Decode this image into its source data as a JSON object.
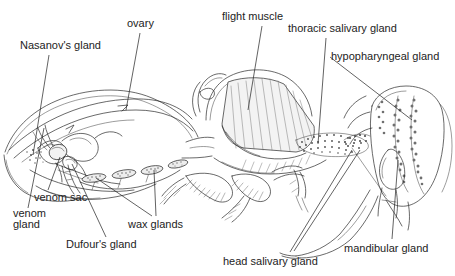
{
  "diagram": {
    "type": "anatomical-line-drawing",
    "background_color": "#ffffff",
    "ink_color": "#2a2a2a",
    "text_color": "#232323",
    "width": 455,
    "height": 276
  },
  "labels": [
    {
      "id": "nasanovs-gland",
      "text": "Nasanov's gland",
      "x": 20,
      "y": 40
    },
    {
      "id": "ovary",
      "text": "ovary",
      "x": 127,
      "y": 18
    },
    {
      "id": "flight-muscle",
      "text": "flight muscle",
      "x": 222,
      "y": 11
    },
    {
      "id": "thoracic-salivary",
      "text": "thoracic salivary gland",
      "x": 288,
      "y": 23
    },
    {
      "id": "hypopharyngeal-gland",
      "text": "hypopharyngeal gland",
      "x": 331,
      "y": 51
    },
    {
      "id": "venom-sac",
      "text": "venom sac",
      "x": 34,
      "y": 192
    },
    {
      "id": "venom-gland-line1",
      "text": "venom",
      "x": 13,
      "y": 208
    },
    {
      "id": "venom-gland-line2",
      "text": "gland",
      "x": 13,
      "y": 219
    },
    {
      "id": "dufours-gland",
      "text": "Dufour's gland",
      "x": 66,
      "y": 239
    },
    {
      "id": "wax-glands",
      "text": "wax glands",
      "x": 128,
      "y": 219
    },
    {
      "id": "mandibular-gland",
      "text": "mandibular gland",
      "x": 344,
      "y": 243
    },
    {
      "id": "head-salivary-gland",
      "text": "head salivary gland",
      "x": 223,
      "y": 256
    }
  ],
  "structures": [
    {
      "id": "abdomen",
      "name": "abdomen outline"
    },
    {
      "id": "sting-apparatus",
      "name": "sting apparatus"
    },
    {
      "id": "nasanov-region",
      "name": "Nasanov gland stipple patch"
    },
    {
      "id": "venom-sac-shape",
      "name": "venom sac"
    },
    {
      "id": "wax-gland-plates",
      "name": "wax gland plates (four)"
    },
    {
      "id": "flight-muscle-block",
      "name": "flight muscle block"
    },
    {
      "id": "thoracic-salivary-patch",
      "name": "thoracic salivary gland stipple"
    },
    {
      "id": "head-capsule",
      "name": "head capsule"
    },
    {
      "id": "hypopharyngeal-lobes",
      "name": "hypopharyngeal gland lobes"
    },
    {
      "id": "mandibular-sac",
      "name": "mandibular gland sac"
    },
    {
      "id": "proboscis",
      "name": "proboscis / tongue"
    },
    {
      "id": "legs",
      "name": "legs with setae"
    }
  ]
}
